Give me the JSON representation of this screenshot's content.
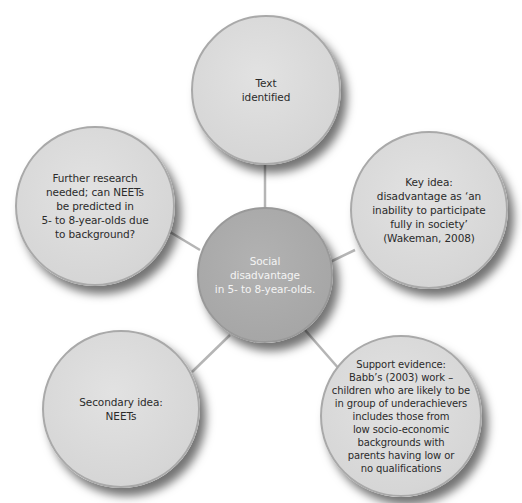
{
  "diagram": {
    "type": "mind-map",
    "center": {
      "label": "Social\ndisadvantage\nin 5- to 8-year-olds."
    },
    "nodes": [
      {
        "id": "top",
        "label": "Text\nidentified"
      },
      {
        "id": "left",
        "label": "Further research\nneeded; can NEETs\nbe predicted in\n5- to 8-year-olds due\nto background?"
      },
      {
        "id": "right",
        "label": "Key idea:\ndisadvantage as ‘an\ninability to participate\nfully in society’\n(Wakeman, 2008)"
      },
      {
        "id": "bottom-left",
        "label": "Secondary idea:\nNEETs"
      },
      {
        "id": "bottom-right",
        "label": "Support evidence:\nBabb’s (2003) work –\nchildren who are likely to be\nin group of underachievers\nincludes those from\nlow socio-economic\nbackgrounds with\nparents having low or\nno qualifications"
      }
    ],
    "colors": {
      "outer_fill": "#d8d8d8",
      "center_fill": "#a8a8a8",
      "connector": "#b5b5b5",
      "outer_text": "#2b2b2b",
      "center_text": "#f4f4f4"
    }
  }
}
